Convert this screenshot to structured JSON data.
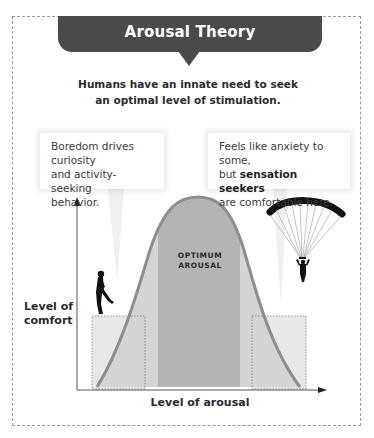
{
  "title": "Arousal Theory",
  "subtitle": {
    "line1": "Humans have an innate need to seek",
    "line2": "an optimal level of stimulation."
  },
  "callouts": {
    "left": {
      "line1": "Boredom drives curiosity",
      "line2": "and activity-seeking",
      "line3": "behavior."
    },
    "right": {
      "line1": "Feels like anxiety to some,",
      "line2_prefix": "but ",
      "line2_bold": "sensation seekers",
      "line3": "are comfortable here."
    }
  },
  "graph": {
    "y_axis_label_line1": "Level of",
    "y_axis_label_line2": "comfort",
    "x_axis_label": "Level of arousal",
    "center_label_line1": "OPTIMUM",
    "center_label_line2": "AROUSAL",
    "illustrations": [
      "walking-person-icon",
      "parachutist-icon"
    ]
  },
  "colors": {
    "banner": "#4a4a4a",
    "curve_fill": "#d3d3d3",
    "curve_stroke": "#8f8f8f",
    "optimum_band": "#b3b3b3",
    "zone_box": "#e6e6e6",
    "axis": "#555555"
  }
}
